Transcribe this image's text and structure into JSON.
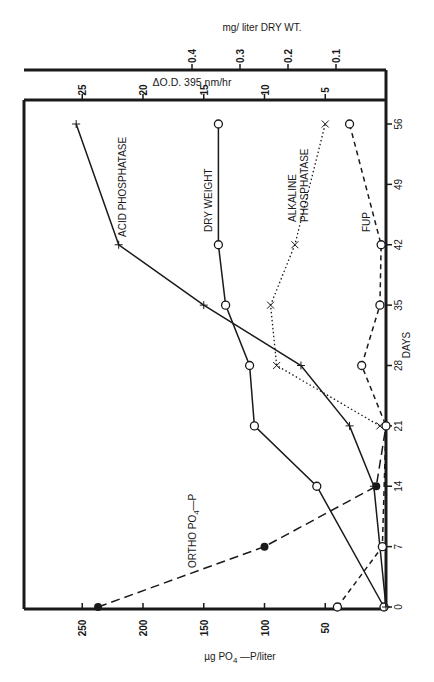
{
  "chart_data": {
    "type": "line",
    "orientation": "rotated-90",
    "title": "",
    "xlabel": "DAYS",
    "x": [
      0,
      7,
      14,
      21,
      28,
      35,
      42,
      56
    ],
    "x_ticks": [
      "0",
      "7",
      "14",
      "21",
      "28",
      "35",
      "42",
      "49",
      "56"
    ],
    "axes": {
      "primary_value": {
        "label": "µg PO4 — P/liter",
        "ticks": [
          "50",
          "100",
          "150",
          "200",
          "250"
        ],
        "range": [
          0,
          260
        ]
      },
      "od_value": {
        "label": "ΔO.D. 395 nm/hr",
        "ticks": [
          "5",
          "10",
          "15",
          "20",
          "25"
        ],
        "range": [
          0,
          26
        ]
      },
      "dry_weight_value": {
        "label": "mg/ liter DRY WT.",
        "ticks": [
          "0.1",
          "0.2",
          "0.3",
          "0.4"
        ],
        "range": [
          0,
          0.42
        ]
      }
    },
    "series": [
      {
        "name": "ORTHO PO4-P",
        "axis": "primary_value",
        "marker": "filled-circle",
        "line": "long-dash",
        "x": [
          0,
          7,
          14,
          21
        ],
        "values": [
          237,
          100,
          8,
          0
        ]
      },
      {
        "name": "DRY WEIGHT",
        "axis": "dry_weight_value",
        "marker": "open-circle",
        "line": "solid",
        "x": [
          0,
          14,
          21,
          28,
          35,
          42,
          56
        ],
        "values": [
          0.0,
          0.14,
          0.27,
          0.28,
          0.33,
          0.345,
          0.345
        ]
      },
      {
        "name": "ACID PHOSPHATASE",
        "axis": "od_value",
        "marker": "plus",
        "line": "solid",
        "x": [
          0,
          14,
          21,
          28,
          35,
          42,
          56
        ],
        "values": [
          0,
          1,
          3,
          7,
          15,
          22,
          25.5
        ]
      },
      {
        "name": "ALKALINE PHOSPHATASE",
        "axis": "od_value",
        "marker": "x",
        "line": "dotted",
        "x": [
          21,
          28,
          35,
          42,
          56
        ],
        "values": [
          0.5,
          9,
          9.5,
          7.5,
          5
        ]
      },
      {
        "name": "FUP",
        "axis": "primary_value",
        "marker": "open-circle",
        "line": "short-dash",
        "x": [
          0,
          7,
          21,
          28,
          35,
          42,
          56
        ],
        "values": [
          40,
          3,
          0,
          20,
          5,
          4,
          30
        ]
      }
    ],
    "annotations": [
      "ACID PHOSPHATASE",
      "DRY WEIGHT",
      "ALKALINE PHOSPHATASE",
      "FUP",
      "ORTHO PO4—P"
    ],
    "grid": false,
    "legend": "inline labels"
  },
  "labels": {
    "dry_wt_axis": "mg/ liter DRY WT.",
    "od_axis": "ΔO.D. 395 nm/hr",
    "po4_axis_mu": "µg PO",
    "po4_axis_sub": "4",
    "po4_axis_rest": " —P/liter",
    "days_axis": "DAYS",
    "acid": "ACID PHOSPHATASE",
    "dry": "DRY WEIGHT",
    "alk1": "ALKALINE",
    "alk2": "PHOSPHATASE",
    "fup": "FUP",
    "ortho": "ORTHO  PO",
    "ortho_sub": "4",
    "ortho_rest": "—P"
  }
}
